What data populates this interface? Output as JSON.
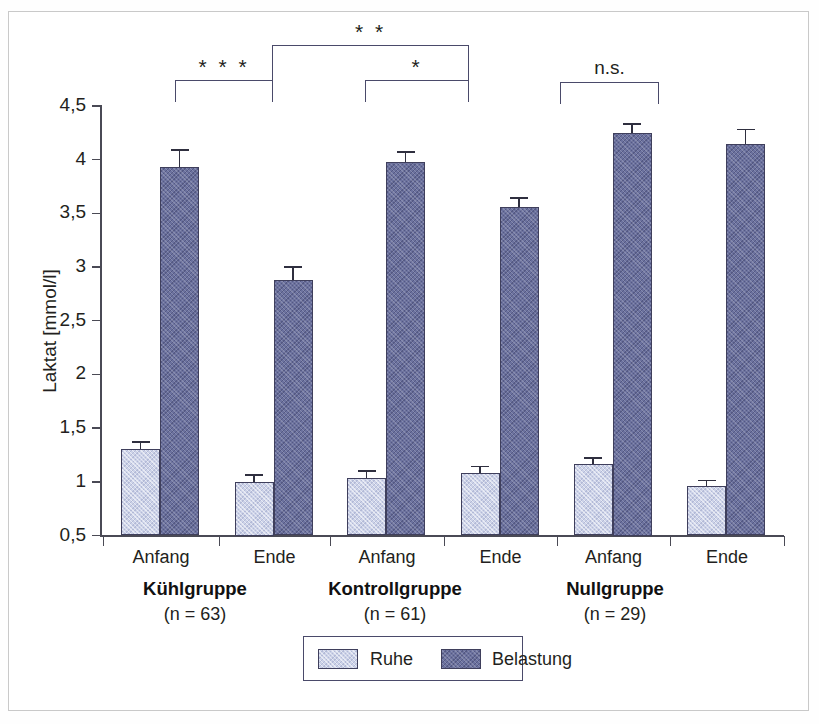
{
  "chart_data": {
    "type": "bar",
    "title": "",
    "xlabel": "",
    "ylabel": "Laktat [mmol/l]",
    "ylim": [
      0.5,
      4.5
    ],
    "ytick_labels": [
      "4,5",
      "4",
      "3,5",
      "3",
      "2,5",
      "2",
      "1,5",
      "1",
      "0,5"
    ],
    "ytick_values": [
      4.5,
      4.0,
      3.5,
      3.0,
      2.5,
      2.0,
      1.5,
      1.0,
      0.5
    ],
    "grid": false,
    "legend_position": "bottom-center",
    "categories": [
      "Anfang",
      "Ende",
      "Anfang",
      "Ende",
      "Anfang",
      "Ende"
    ],
    "groups": [
      {
        "name": "Kühlgruppe",
        "n_label": "(n = 63)"
      },
      {
        "name": "Kontrollgruppe",
        "n_label": "(n = 61)"
      },
      {
        "name": "Nullgruppe",
        "n_label": "(n = 29)"
      }
    ],
    "series": [
      {
        "name": "Ruhe",
        "color": "#ccd2e8",
        "values": [
          1.31,
          1.0,
          1.04,
          1.08,
          1.17,
          0.96
        ],
        "errors": [
          0.07,
          0.07,
          0.07,
          0.07,
          0.06,
          0.06
        ]
      },
      {
        "name": "Belastung",
        "color": "#6b719e",
        "values": [
          3.93,
          2.88,
          3.98,
          3.56,
          4.25,
          4.15
        ],
        "errors": [
          0.17,
          0.13,
          0.1,
          0.09,
          0.09,
          0.14
        ]
      }
    ],
    "annotations": [
      {
        "label": "* * *",
        "from": "Kühlgruppe Anfang",
        "to": "Kühlgruppe Ende",
        "level": 1
      },
      {
        "label": "* *",
        "from": "Kühlgruppe Ende",
        "to": "Kontrollgruppe Ende",
        "level": 2
      },
      {
        "label": "*",
        "from": "Kontrollgruppe Anfang",
        "to": "Kontrollgruppe Ende",
        "level": 1
      },
      {
        "label": "n.s.",
        "from": "Nullgruppe Anfang",
        "to": "Nullgruppe Ende",
        "level": 1
      }
    ]
  },
  "axis": {
    "y_title": "Laktat [mmol/l]",
    "ticks": [
      {
        "label": "4,5"
      },
      {
        "label": "4"
      },
      {
        "label": "3,5"
      },
      {
        "label": "3"
      },
      {
        "label": "2,5"
      },
      {
        "label": "2"
      },
      {
        "label": "1,5"
      },
      {
        "label": "1"
      },
      {
        "label": "0,5"
      }
    ]
  },
  "x_categories": [
    {
      "label": "Anfang"
    },
    {
      "label": "Ende"
    },
    {
      "label": "Anfang"
    },
    {
      "label": "Ende"
    },
    {
      "label": "Anfang"
    },
    {
      "label": "Ende"
    }
  ],
  "groups": [
    {
      "name": "Kühlgruppe",
      "n_label": "(n = 63)"
    },
    {
      "name": "Kontrollgruppe",
      "n_label": "(n = 61)"
    },
    {
      "name": "Nullgruppe",
      "n_label": "(n = 29)"
    }
  ],
  "brackets": [
    {
      "label": "* * *"
    },
    {
      "label": "* *"
    },
    {
      "label": "*"
    },
    {
      "label": "n.s."
    }
  ],
  "legend": {
    "items": [
      {
        "label": "Ruhe",
        "color": "#ccd2e8"
      },
      {
        "label": "Belastung",
        "color": "#6b719e"
      }
    ]
  },
  "colors": {
    "ruhe": "#ccd2e8",
    "belastung": "#6b719e",
    "axis": "#4a4a55",
    "bar_outline": "#3f3f5c",
    "frame": "#c9c9c9"
  }
}
